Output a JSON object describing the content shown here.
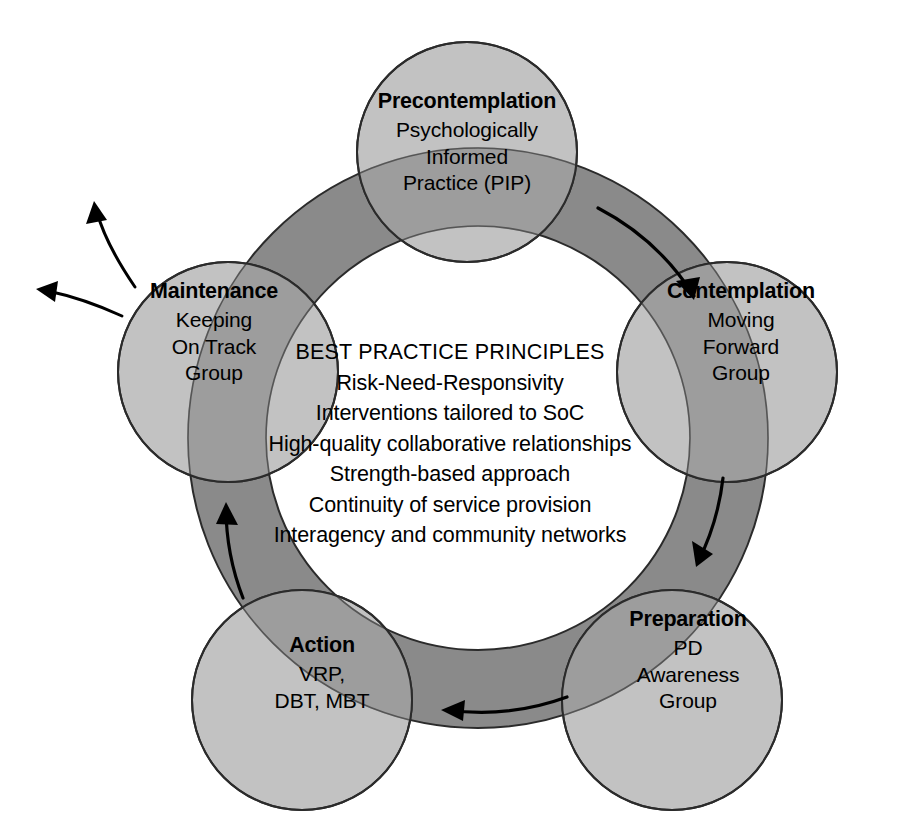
{
  "diagram": {
    "type": "cycle-diagram",
    "colors": {
      "background": "#ffffff",
      "ring_band": "#8a8a8a",
      "node_circle": "#b3b3b3",
      "overlap": "#9d9d9d",
      "outline": "#2b2b2b",
      "text": "#000000",
      "arrow": "#000000"
    },
    "geometry": {
      "ring_center_x": 478,
      "ring_center_y": 438,
      "ring_mid_radius": 250,
      "ring_band_width": 78,
      "node_radius": 110
    },
    "nodes": [
      {
        "id": "precontemplation",
        "title": "Precontemplation",
        "sub_lines": [
          "Psychologically",
          "Informed",
          "Practice (PIP)"
        ],
        "cx": 467,
        "cy": 152,
        "label_x": 467,
        "label_y": 92
      },
      {
        "id": "contemplation",
        "title": "Contemplation",
        "sub_lines": [
          "Moving",
          "Forward",
          "Group"
        ],
        "cx": 727,
        "cy": 372,
        "label_x": 741,
        "label_y": 312
      },
      {
        "id": "preparation",
        "title": "Preparation",
        "sub_lines": [
          "PD",
          "Awareness",
          "Group"
        ],
        "cx": 672,
        "cy": 700,
        "label_x": 688,
        "label_y": 640
      },
      {
        "id": "action",
        "title": "Action",
        "sub_lines": [
          "VRP,",
          "DBT, MBT"
        ],
        "cx": 302,
        "cy": 700,
        "label_x": 318,
        "label_y": 664
      },
      {
        "id": "maintenance",
        "title": "Maintenance",
        "sub_lines": [
          "Keeping",
          "On Track",
          "Group"
        ],
        "cx": 228,
        "cy": 372,
        "label_x": 212,
        "label_y": 312
      }
    ],
    "center": {
      "heading": "BEST PRACTICE PRINCIPLES",
      "lines": [
        "Risk-Need-Responsivity",
        "Interventions tailored to SoC",
        "High-quality collaborative relationships",
        "Strength-based approach",
        "Continuity of service provision",
        "Interagency and community networks"
      ]
    },
    "ring_arrows": [
      {
        "id": "arrow-precontemplation-to-contemplation",
        "direction": "clockwise",
        "segment": "top-right"
      },
      {
        "id": "arrow-contemplation-to-preparation",
        "direction": "clockwise",
        "segment": "right"
      },
      {
        "id": "arrow-preparation-to-action",
        "direction": "clockwise",
        "segment": "bottom"
      },
      {
        "id": "arrow-action-to-maintenance",
        "direction": "clockwise",
        "segment": "left"
      }
    ],
    "exit_arrows": [
      {
        "id": "exit-arrow-upper",
        "from": "maintenance",
        "direction": "up-left"
      },
      {
        "id": "exit-arrow-lower",
        "from": "maintenance",
        "direction": "left"
      }
    ]
  }
}
